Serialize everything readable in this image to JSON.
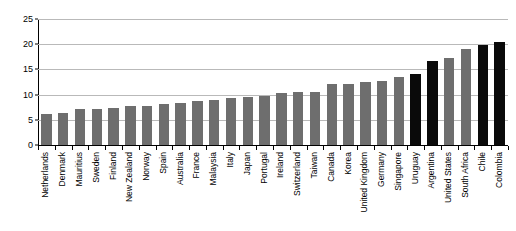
{
  "chart_data": {
    "type": "bar",
    "title": "",
    "subtitle": "",
    "xlabel": "",
    "ylabel": "",
    "ylim": [
      0,
      25
    ],
    "yticks": [
      0,
      5,
      10,
      15,
      20,
      25
    ],
    "ytick_labels": [
      "0",
      "5",
      "10",
      "15",
      "20",
      "25"
    ],
    "grid": true,
    "legend": "none",
    "categories": [
      "Netherlands",
      "Denmark",
      "Mauritius",
      "Sweden",
      "Finland",
      "New Zealand",
      "Norway",
      "Spain",
      "Australia",
      "France",
      "Malaysia",
      "Italy",
      "Japan",
      "Portugal",
      "Ireland",
      "Switzerland",
      "Taiwan",
      "Canada",
      "Korea",
      "United Kingdom",
      "Germany",
      "Singapore",
      "Uruguay",
      "Argentina",
      "United States",
      "South Africa",
      "Chile",
      "Colombia"
    ],
    "values": [
      6.2,
      6.4,
      7.1,
      7.2,
      7.4,
      7.7,
      7.8,
      8.1,
      8.3,
      8.8,
      9.0,
      9.3,
      9.5,
      9.7,
      10.4,
      10.5,
      10.6,
      12.2,
      12.2,
      12.6,
      12.7,
      13.5,
      14.0,
      16.7,
      17.3,
      19.1,
      19.9,
      20.4
    ],
    "bar_colors": [
      "gray",
      "gray",
      "gray",
      "gray",
      "gray",
      "gray",
      "gray",
      "gray",
      "gray",
      "gray",
      "gray",
      "gray",
      "gray",
      "gray",
      "gray",
      "gray",
      "gray",
      "gray",
      "gray",
      "gray",
      "gray",
      "gray",
      "black",
      "black",
      "gray",
      "gray",
      "black",
      "black"
    ],
    "colors": {
      "gray": "#6e6e6e",
      "black": "#0a0a0a",
      "gridline": "#b9b9b9",
      "axis": "#000000",
      "background": "#ffffff"
    }
  }
}
